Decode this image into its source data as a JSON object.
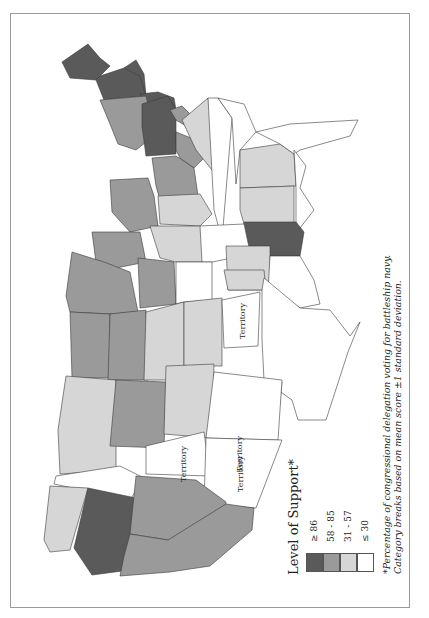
{
  "map": {
    "title": "Level of Support*",
    "footnote": {
      "line1": "*Percentage of congressional delegation voting for battleship navy.",
      "line2": "Category breaks based on mean score ±1 standard deviation."
    },
    "legend": [
      {
        "label": "≥ 86",
        "color": "#5a5a5a"
      },
      {
        "label": "58 - 85",
        "color": "#9a9a9a"
      },
      {
        "label": "31 - 57",
        "color": "#d6d6d6"
      },
      {
        "label": "≤ 30",
        "color": "#ffffff"
      }
    ],
    "territory_label": "Territory",
    "territories": [
      "Territory",
      "Territory",
      "Territory",
      "Territory",
      "Territory"
    ]
  },
  "colors": {
    "dark": "#5a5a5a",
    "medium": "#9a9a9a",
    "light": "#d6d6d6",
    "white": "#ffffff",
    "stroke": "#3a3a3a",
    "border": "#9a9a9a"
  }
}
